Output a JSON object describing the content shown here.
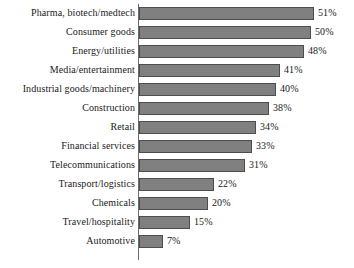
{
  "chart_data": {
    "type": "bar",
    "orientation": "horizontal",
    "title": "",
    "subtitle": "",
    "xlabel": "",
    "ylabel": "",
    "xlim": [
      0,
      55
    ],
    "grid": false,
    "legend": false,
    "value_suffix": "%",
    "categories": [
      "Pharma, biotech/medtech",
      "Consumer goods",
      "Energy/utilities",
      "Media/entertainment",
      "Industrial goods/machinery",
      "Construction",
      "Retail",
      "Financial services",
      "Telecommunications",
      "Transport/logistics",
      "Chemicals",
      "Travel/hospitality",
      "Automotive"
    ],
    "values": [
      51,
      50,
      48,
      41,
      40,
      38,
      34,
      33,
      31,
      22,
      20,
      15,
      7
    ],
    "value_labels": [
      "51%",
      "50%",
      "48%",
      "41%",
      "40%",
      "38%",
      "34%",
      "33%",
      "31%",
      "22%",
      "20%",
      "15%",
      "7%"
    ],
    "colors": {
      "bar_fill": "#808080",
      "bar_border": "#4d4d4d",
      "axis": "#6b6b6b",
      "text": "#1a1a1a",
      "background": "#ffffff"
    }
  }
}
